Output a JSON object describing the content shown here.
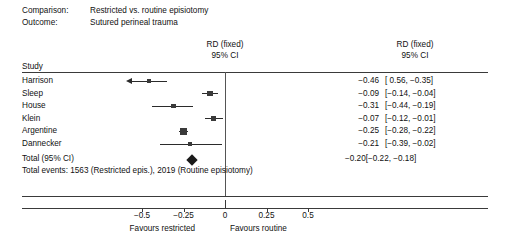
{
  "meta": {
    "comparison_key": "Comparison:",
    "comparison_value": "Restricted vs. routine episiotomy",
    "outcome_key": "Outcome:",
    "outcome_value": "Sutured perineal trauma"
  },
  "headers": {
    "study": "Study",
    "plot_col_line1": "RD (fixed)",
    "plot_col_line2": "95% CI",
    "num_col_line1": "RD (fixed)",
    "num_col_line2": "95% CI"
  },
  "totals": {
    "label": "Total (95% CI)",
    "estimate": "−0.20",
    "ci": "[−0.22, −0.18]",
    "events_text": "Total events: 1563 (Restricted epis.), 2019 (Routine episiotomy)"
  },
  "axis": {
    "ticks": [
      "−0.5",
      "−0.25",
      "0",
      "0.25",
      "0.5"
    ],
    "favours_left": "Favours restricted",
    "favours_right": "Favours routine"
  },
  "colors": {
    "marker": "#3a3a3a",
    "line": "#2b2b2b",
    "rule": "#3a3a3a",
    "diamond": "#1a1a1a"
  },
  "chart_data": {
    "type": "forest",
    "title": "",
    "xlabel": "",
    "ylabel": "",
    "effect_measure": "RD (fixed)",
    "ci_level": "95% CI",
    "xlim": [
      -0.625,
      0.625
    ],
    "xticks": [
      -0.5,
      -0.25,
      0,
      0.25,
      0.5
    ],
    "grid": false,
    "null_line": 0,
    "legend": "none",
    "studies": [
      {
        "name": "Harrison",
        "estimate": -0.46,
        "ci_low": -0.56,
        "ci_high": -0.35,
        "estimate_text": "−0.46",
        "ci_text": "[ 0.56, −0.35]",
        "weight": 0.08,
        "ci_low_truncated": true
      },
      {
        "name": "Sleep",
        "estimate": -0.09,
        "ci_low": -0.14,
        "ci_high": -0.04,
        "estimate_text": "−0.09",
        "ci_text": "[−0.14, −0.04]",
        "weight": 0.18,
        "ci_low_truncated": false
      },
      {
        "name": "House",
        "estimate": -0.31,
        "ci_low": -0.44,
        "ci_high": -0.19,
        "estimate_text": "−0.31",
        "ci_text": "[−0.44, −0.19]",
        "weight": 0.1,
        "ci_low_truncated": false
      },
      {
        "name": "Klein",
        "estimate": -0.07,
        "ci_low": -0.12,
        "ci_high": -0.01,
        "estimate_text": "−0.07",
        "ci_text": "[−0.12, −0.01]",
        "weight": 0.16,
        "ci_low_truncated": false
      },
      {
        "name": "Argentine",
        "estimate": -0.25,
        "ci_low": -0.28,
        "ci_high": -0.22,
        "estimate_text": "−0.25",
        "ci_text": "[−0.28, −0.22]",
        "weight": 0.4,
        "ci_low_truncated": false
      },
      {
        "name": "Dannecker",
        "estimate": -0.21,
        "ci_low": -0.39,
        "ci_high": -0.02,
        "estimate_text": "−0.21",
        "ci_text": "[−0.39, −0.02]",
        "weight": 0.08,
        "ci_low_truncated": false
      }
    ],
    "pooled": {
      "name": "Total (95% CI)",
      "estimate": -0.2,
      "ci_low": -0.22,
      "ci_high": -0.18,
      "estimate_text": "−0.20",
      "ci_text": "[−0.22, −0.18]"
    },
    "total_events": {
      "restricted": 1563,
      "routine": 2019
    }
  }
}
